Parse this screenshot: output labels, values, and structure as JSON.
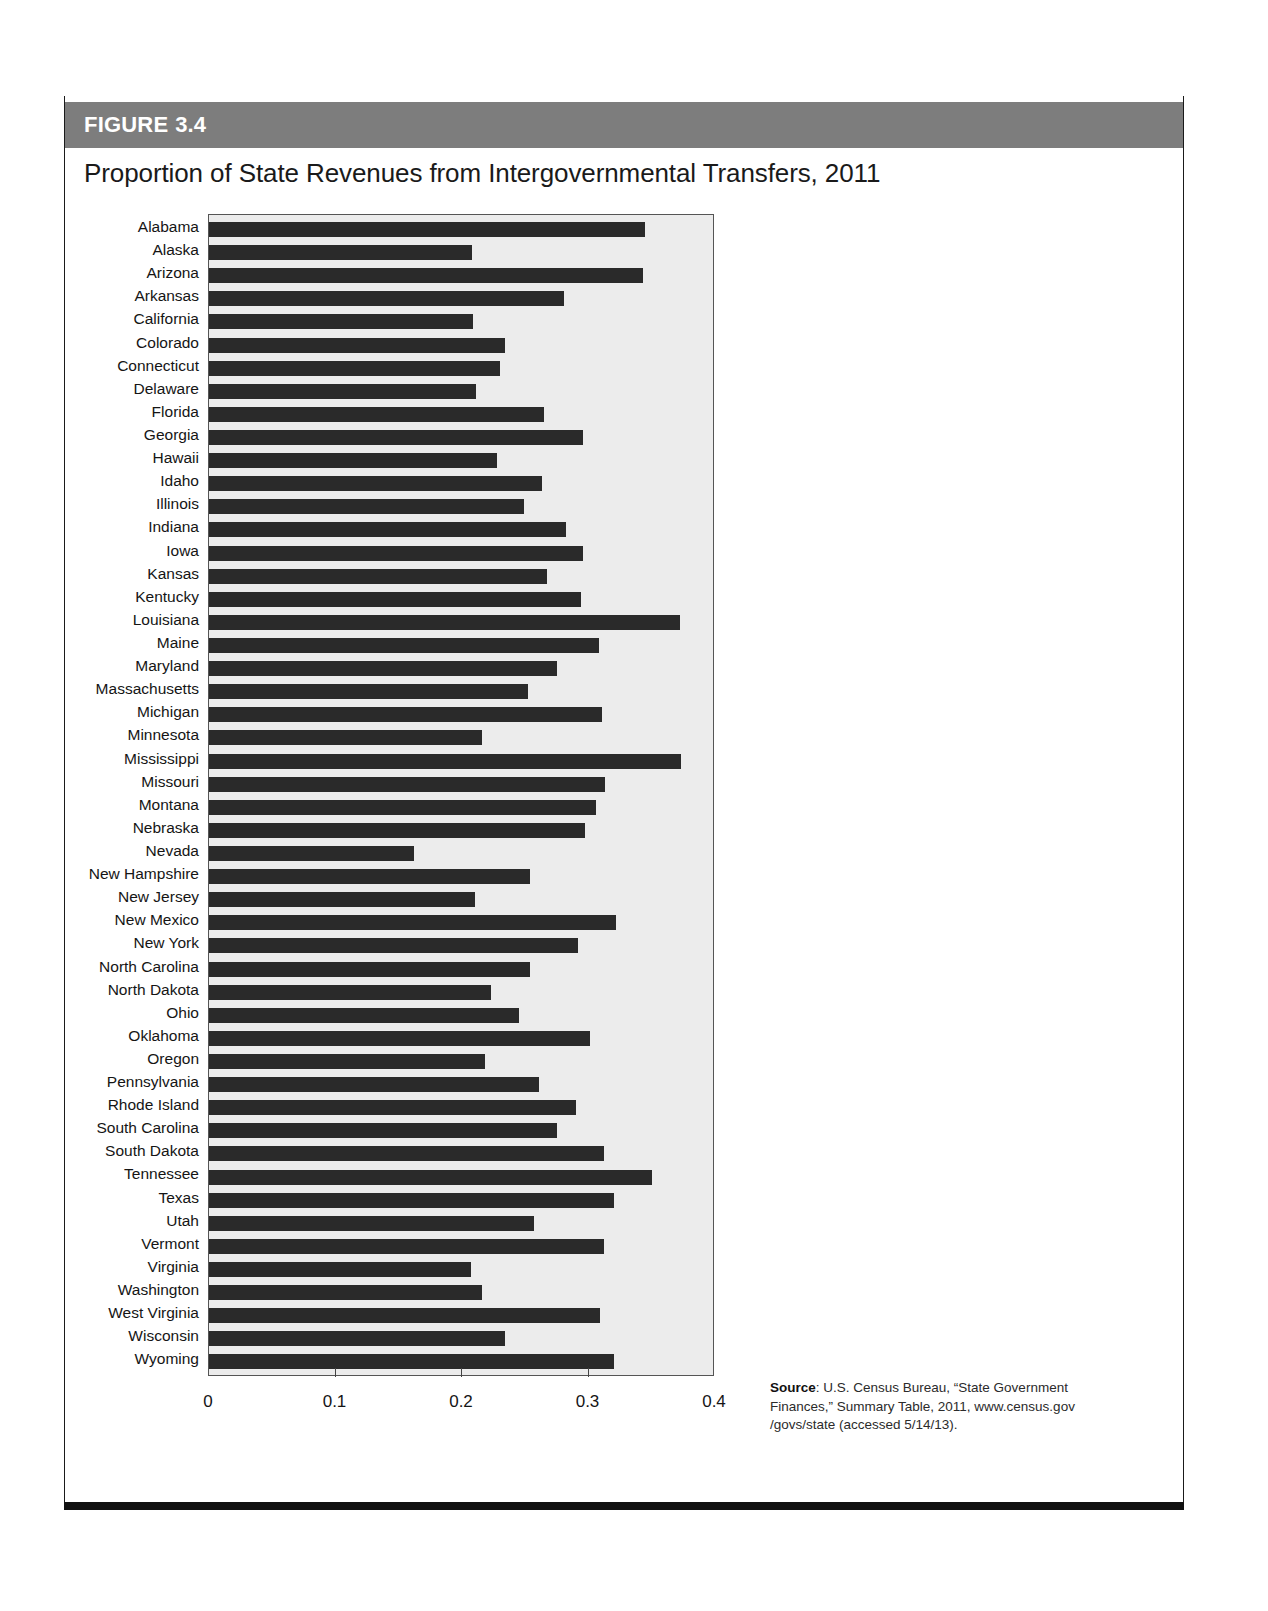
{
  "figure": {
    "label": "FIGURE",
    "number": "3.4",
    "title": "Proportion of State Revenues from Intergovernmental Transfers, 2011"
  },
  "source": {
    "label": "Source",
    "text": ": U.S. Census Bureau, “State Government Finances,” Summary Table, 2011, www.census.gov /govs/state (accessed 5/14/13)."
  },
  "colors": {
    "header_band": "#7d7d7d",
    "bar_fill": "#2a2a2a",
    "plot_background": "#ececec",
    "rule": "#111111"
  },
  "chart_data": {
    "type": "bar",
    "orientation": "horizontal",
    "title": "Proportion of State Revenues from Intergovernmental Transfers, 2011",
    "xlabel": "",
    "ylabel": "",
    "xlim": [
      0,
      0.4
    ],
    "xticks": [
      0,
      0.1,
      0.2,
      0.3,
      0.4
    ],
    "xtick_labels": [
      "0",
      "0.1",
      "0.2",
      "0.3",
      "0.4"
    ],
    "grid": false,
    "legend": null,
    "categories": [
      "Alabama",
      "Alaska",
      "Arizona",
      "Arkansas",
      "California",
      "Colorado",
      "Connecticut",
      "Delaware",
      "Florida",
      "Georgia",
      "Hawaii",
      "Idaho",
      "Illinois",
      "Indiana",
      "Iowa",
      "Kansas",
      "Kentucky",
      "Louisiana",
      "Maine",
      "Maryland",
      "Massachusetts",
      "Michigan",
      "Minnesota",
      "Mississippi",
      "Missouri",
      "Montana",
      "Nebraska",
      "Nevada",
      "New Hampshire",
      "New Jersey",
      "New Mexico",
      "New York",
      "North Carolina",
      "North Dakota",
      "Ohio",
      "Oklahoma",
      "Oregon",
      "Pennsylvania",
      "Rhode Island",
      "South Carolina",
      "South Dakota",
      "Tennessee",
      "Texas",
      "Utah",
      "Vermont",
      "Virginia",
      "Washington",
      "West Virginia",
      "Wisconsin",
      "Wyoming"
    ],
    "values": [
      0.345,
      0.208,
      0.343,
      0.281,
      0.209,
      0.234,
      0.23,
      0.211,
      0.265,
      0.296,
      0.228,
      0.263,
      0.249,
      0.282,
      0.296,
      0.267,
      0.294,
      0.372,
      0.308,
      0.275,
      0.252,
      0.311,
      0.216,
      0.373,
      0.313,
      0.306,
      0.297,
      0.162,
      0.254,
      0.21,
      0.322,
      0.292,
      0.254,
      0.223,
      0.245,
      0.301,
      0.218,
      0.261,
      0.29,
      0.275,
      0.312,
      0.35,
      0.32,
      0.257,
      0.312,
      0.207,
      0.216,
      0.309,
      0.234,
      0.32
    ]
  }
}
